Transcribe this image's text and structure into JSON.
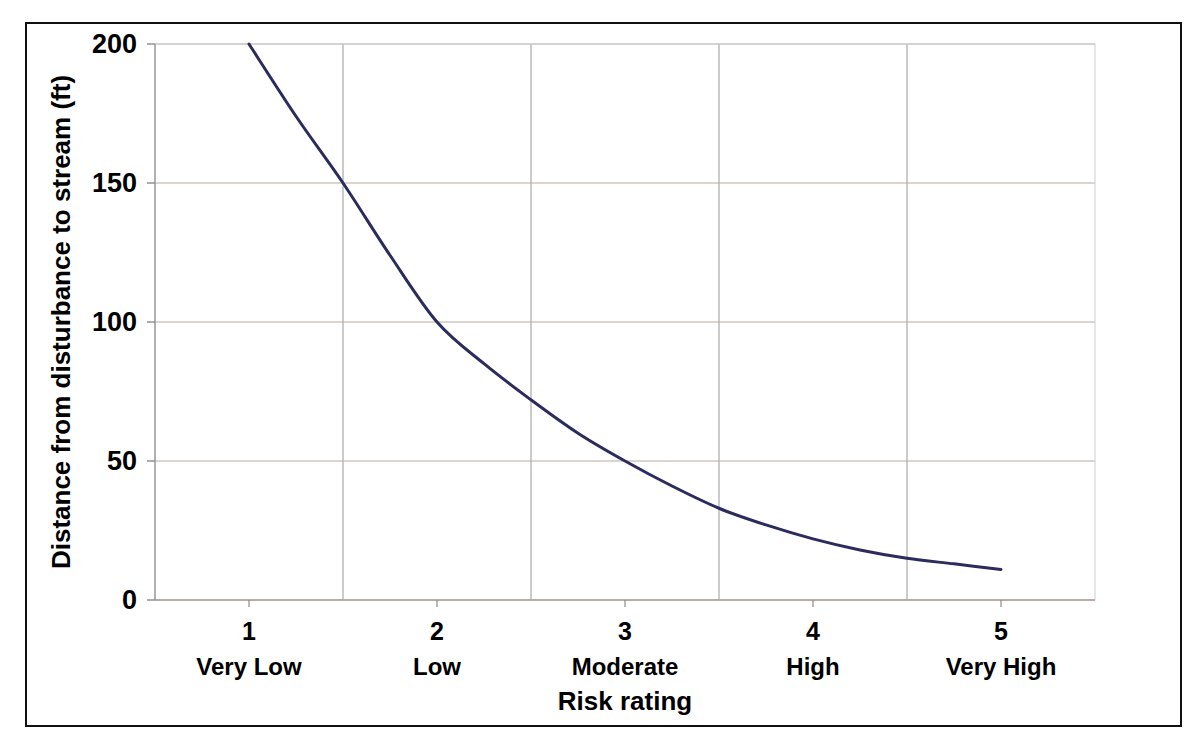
{
  "figure": {
    "background_color": "#ffffff",
    "border_color": "#111111"
  },
  "chart_data": {
    "type": "line",
    "title": "",
    "xlabel": "Risk rating",
    "ylabel": "Distance from disturbance to stream (ft)",
    "xlim": [
      0.5,
      5.5
    ],
    "ylim": [
      0,
      200
    ],
    "xticks": [
      1,
      2,
      3,
      4,
      5
    ],
    "xtick_labels": [
      "1",
      "2",
      "3",
      "4",
      "5"
    ],
    "category_labels": [
      "Very Low",
      "Low",
      "Moderate",
      "High",
      "Very High"
    ],
    "yticks": [
      0,
      50,
      100,
      150,
      200
    ],
    "ytick_labels": [
      "0",
      "50",
      "100",
      "150",
      "200"
    ],
    "grid": true,
    "grid_color_horizontal": "#b9a9a0",
    "grid_color_vertical": "#a9a9a9",
    "legend": false,
    "series": [
      {
        "name": "Distance from disturbance to stream",
        "color": "#2b2b5e",
        "line_width": 3,
        "x": [
          1.0,
          1.25,
          1.5,
          1.75,
          2.0,
          2.25,
          2.5,
          2.75,
          3.0,
          3.25,
          3.5,
          3.75,
          4.0,
          4.25,
          4.5,
          4.75,
          5.0
        ],
        "values": [
          200,
          174,
          150,
          124,
          100,
          85,
          72,
          60,
          50,
          41,
          33,
          27,
          22,
          18,
          15,
          13,
          11
        ]
      }
    ]
  },
  "labels": {
    "y_axis_title": "Distance from disturbance to stream (ft)",
    "x_axis_title": "Risk rating"
  }
}
